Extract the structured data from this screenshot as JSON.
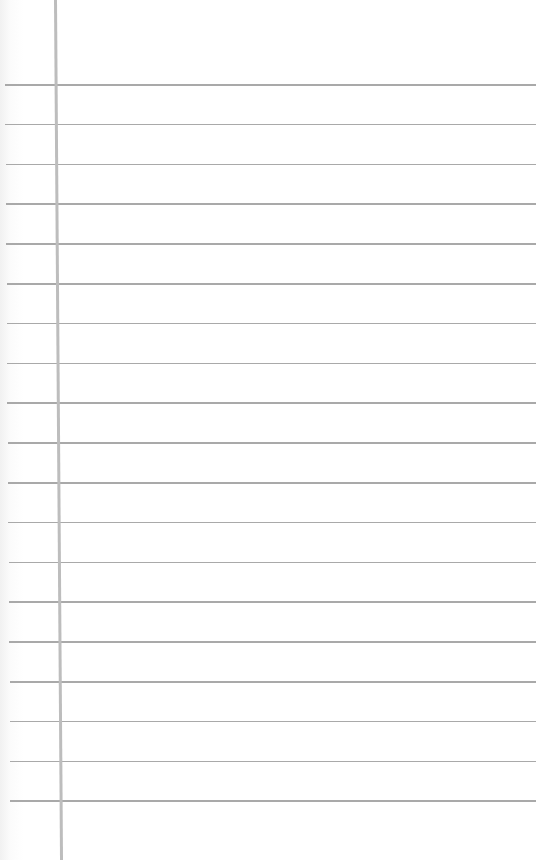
{
  "paper": {
    "type": "lined-notebook-page",
    "background_color": "#ffffff",
    "rule_color": "#a9a9a9",
    "margin_line_color": "#bdbdbd",
    "rule_count": 19,
    "first_rule_y": 84,
    "rule_spacing": 39.8,
    "margin_line_x": 54
  }
}
